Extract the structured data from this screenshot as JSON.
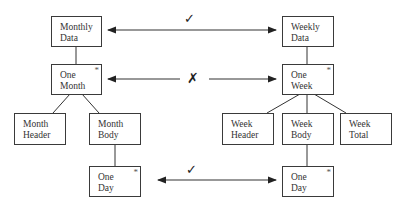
{
  "diagram": {
    "nodes": {
      "monthly_data": {
        "line1": "Monthly",
        "line2": "Data"
      },
      "one_month": {
        "line1": "One",
        "line2": "Month",
        "marker": "*"
      },
      "month_header": {
        "line1": "Month",
        "line2": "Header"
      },
      "month_body": {
        "line1": "Month",
        "line2": "Body"
      },
      "one_day_left": {
        "line1": "One",
        "line2": "Day",
        "marker": "*"
      },
      "weekly_data": {
        "line1": "Weekly",
        "line2": "Data"
      },
      "one_week": {
        "line1": "One",
        "line2": "Week",
        "marker": "*"
      },
      "week_header": {
        "line1": "Week",
        "line2": "Header"
      },
      "week_body": {
        "line1": "Week",
        "line2": "Body"
      },
      "week_total": {
        "line1": "Week",
        "line2": "Total"
      },
      "one_day_right": {
        "line1": "One",
        "line2": "Day",
        "marker": "*"
      }
    },
    "correspondences": [
      {
        "from": "Monthly Data",
        "to": "Weekly Data",
        "mark": "✓"
      },
      {
        "from": "One Month",
        "to": "One Week",
        "mark": "✗"
      },
      {
        "from": "One Day",
        "to": "One Day",
        "mark": "✓"
      }
    ]
  }
}
